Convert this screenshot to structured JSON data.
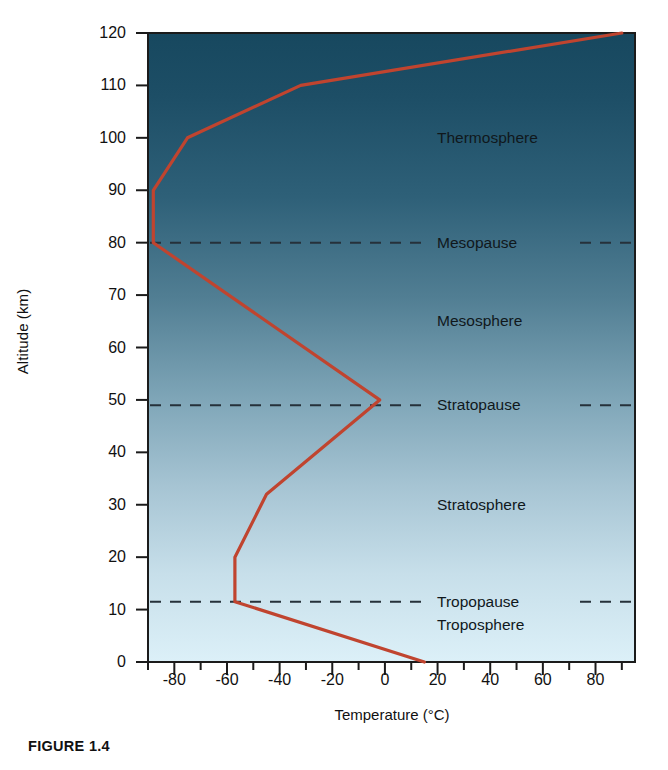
{
  "figure": {
    "caption": "FIGURE 1.4"
  },
  "axes": {
    "y_title": "Altitude (km)",
    "x_title": "Temperature (°C)",
    "y_ticks": [
      "0",
      "10",
      "20",
      "30",
      "40",
      "50",
      "60",
      "70",
      "80",
      "90",
      "100",
      "110",
      "120"
    ],
    "x_ticks": [
      "-80",
      "-60",
      "-40",
      "-20",
      "0",
      "20",
      "40",
      "60",
      "80"
    ]
  },
  "colors": {
    "line": "#c0442f",
    "frame": "#1b1b1b",
    "dash": "#26313a",
    "bg_top": "#1d4e66",
    "bg_bottom": "#dcf0f8",
    "text": "#111111"
  },
  "layers": [
    {
      "name": "Thermosphere",
      "altitude": 100,
      "type": "layer"
    },
    {
      "name": "Mesopause",
      "altitude": 80,
      "type": "boundary"
    },
    {
      "name": "Mesosphere",
      "altitude": 65,
      "type": "layer"
    },
    {
      "name": "Stratopause",
      "altitude": 49,
      "type": "boundary"
    },
    {
      "name": "Stratosphere",
      "altitude": 30,
      "type": "layer"
    },
    {
      "name": "Tropopause",
      "altitude": 11.5,
      "type": "boundary"
    },
    {
      "name": "Troposphere",
      "altitude": 7,
      "type": "layer"
    }
  ],
  "chart_data": {
    "type": "line",
    "title": "FIGURE 1.4",
    "xlabel": "Temperature (°C)",
    "ylabel": "Altitude (km)",
    "xlim": [
      -90,
      95
    ],
    "ylim": [
      0,
      120
    ],
    "grid": false,
    "legend": false,
    "orientation": "temperature-vs-altitude",
    "series": [
      {
        "name": "Temperature profile",
        "color": "#c0442f",
        "x": [
          15,
          -57,
          -57,
          -45,
          -2,
          -88,
          -88,
          -75,
          -32,
          90
        ],
        "y": [
          0,
          11.5,
          20,
          32,
          50,
          80,
          90,
          100,
          110,
          120
        ]
      }
    ],
    "boundaries": [
      {
        "name": "Tropopause",
        "altitude": 11.5
      },
      {
        "name": "Stratopause",
        "altitude": 49
      },
      {
        "name": "Mesopause",
        "altitude": 80
      }
    ]
  }
}
